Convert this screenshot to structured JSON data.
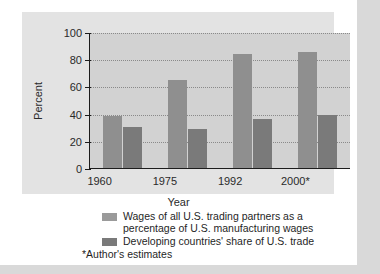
{
  "chart_data": {
    "type": "bar",
    "title": "",
    "xlabel": "Year",
    "ylabel": "Percent",
    "categories": [
      "1960",
      "1975",
      "1992",
      "2000*"
    ],
    "ylim": [
      0,
      100
    ],
    "yticks": [
      0,
      20,
      40,
      60,
      80,
      100
    ],
    "ytick_labels": [
      "0",
      "20",
      "40",
      "60",
      "80",
      "100"
    ],
    "grid": true,
    "legend_position": "below",
    "series": [
      {
        "name": "Wages of all U.S. trading partners as a percentage of U.S. manufacturing wages",
        "color": "#8f8f8f",
        "values": [
          38,
          65,
          84,
          85
        ]
      },
      {
        "name": "Developing countries' share of U.S. trade",
        "color": "#7a7a7a",
        "values": [
          30,
          29,
          36,
          39
        ]
      }
    ],
    "annotations": [
      "*Author's estimates"
    ]
  },
  "axes": {
    "y_title": "Percent",
    "x_title": "Year"
  },
  "legend": {
    "items": [
      {
        "swatch": "series-0-swatch",
        "line1": "Wages of all U.S. trading partners as a",
        "line2": "percentage of U.S. manufacturing wages"
      },
      {
        "swatch": "series-1-swatch",
        "line1": "Developing countries' share of U.S. trade",
        "line2": ""
      }
    ]
  },
  "footnote": {
    "text": "*Author's estimates"
  },
  "colors": {
    "series_0": "#8f8f8f",
    "series_1": "#7a7a7a",
    "panel_background": "#e3e3e3",
    "plot_background": "#d2d2d2",
    "axis": "#1c1c1c",
    "grid": "#8a8a8a"
  }
}
